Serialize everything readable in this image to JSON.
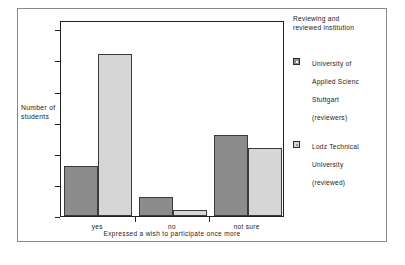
{
  "chart_data": {
    "type": "bar",
    "title": "",
    "categories": [
      "yes",
      "no",
      "not sure"
    ],
    "series": [
      {
        "name": "University of\nApplied Scienc\nStuttgart\n(reviewers)",
        "values": [
          8,
          3,
          13
        ],
        "color": "#8c8c8c"
      },
      {
        "name": "Lodz Technical\nUniversity\n(reviewed)",
        "values": [
          26,
          1,
          11
        ],
        "color": "#d6d6d6"
      }
    ],
    "xlabel": "Expressed a wish to participate once more",
    "ylabel": "Number\nof\nstudents",
    "ylim": [
      0,
      31.5
    ],
    "yticks": [
      0,
      5,
      10,
      15,
      20,
      25,
      30
    ],
    "ytick_labels": [
      "0",
      "5",
      "10",
      "15",
      "20",
      "25",
      "30"
    ],
    "grid": false,
    "legend_position": "right",
    "legend_title": "Reviewing and\nreviewed institution"
  },
  "axes": {
    "y_title": "Number\nof\nstudents",
    "x_title": "Expressed a wish to participate once more"
  },
  "legend": {
    "title": "Reviewing and\nreviewed institution",
    "entries": [
      {
        "label": "University of\nApplied Scienc\nStuttgart\n(reviewers)",
        "swatch": "dark-gray-swatch"
      },
      {
        "label": "Lodz Technical\nUniversity\n(reviewed)",
        "swatch": "light-gray-swatch"
      }
    ]
  },
  "colors": {
    "series0": "#8c8c8c",
    "series1": "#d6d6d6",
    "axis": "#222222",
    "frame": "#8a8a8a",
    "background": "#ffffff"
  }
}
